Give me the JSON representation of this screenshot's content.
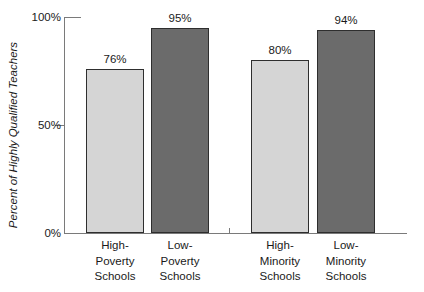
{
  "chart_data": {
    "type": "bar",
    "title": "",
    "xlabel": "",
    "ylabel": "Percent of Highly Qualified Teachers",
    "ylim": [
      0,
      100
    ],
    "grid": false,
    "legend": "none",
    "yticks": [
      {
        "value": 0,
        "label": "0%"
      },
      {
        "value": 50,
        "label": "50%"
      },
      {
        "value": 100,
        "label": "100%"
      }
    ],
    "categories": [
      "High-Poverty Schools",
      "Low-Poverty Schools",
      "High-Minority Schools",
      "Low-Minority Schools"
    ],
    "values": [
      76,
      95,
      80,
      94
    ],
    "bars": [
      {
        "value": 76,
        "value_label": "76%",
        "fill": "#d5d5d5",
        "label_lines": [
          "High-",
          "Poverty",
          "Schools"
        ]
      },
      {
        "value": 95,
        "value_label": "95%",
        "fill": "#6b6b6b",
        "label_lines": [
          "Low-",
          "Poverty",
          "Schools"
        ]
      },
      {
        "value": 80,
        "value_label": "80%",
        "fill": "#d5d5d5",
        "label_lines": [
          "High-",
          "Minority",
          "Schools"
        ]
      },
      {
        "value": 94,
        "value_label": "94%",
        "fill": "#6b6b6b",
        "label_lines": [
          "Low-",
          "Minority",
          "Schools"
        ]
      }
    ],
    "colors": {
      "light_bar": "#d5d5d5",
      "dark_bar": "#6b6b6b",
      "bar_border": "#2e2e2e",
      "axis": "#7a7a7a",
      "text": "#1a1a1a",
      "background": "#ffffff"
    }
  }
}
